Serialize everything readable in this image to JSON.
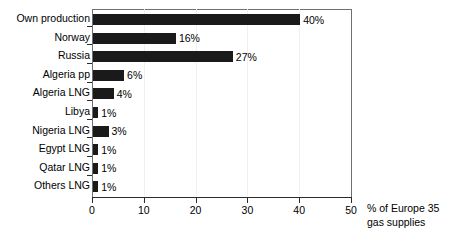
{
  "chart_data": {
    "type": "bar",
    "orientation": "horizontal",
    "title": "",
    "xlabel": "% of Europe 35 gas supplies",
    "ylabel": "",
    "xlim": [
      0,
      50
    ],
    "xticks": [
      0,
      10,
      20,
      30,
      40,
      50
    ],
    "grid": true,
    "legend": null,
    "categories": [
      "Own production",
      "Norway",
      "Russia",
      "Algeria pp",
      "Algeria LNG",
      "Libya",
      "Nigeria LNG",
      "Egypt LNG",
      "Qatar LNG",
      "Others LNG"
    ],
    "values": [
      40,
      16,
      27,
      6,
      4,
      1,
      3,
      1,
      1,
      1
    ],
    "data_labels": [
      "40%",
      "16%",
      "27%",
      "6%",
      "4%",
      "1%",
      "3%",
      "1%",
      "1%",
      "1%"
    ],
    "bar_color": "#1a1a1a"
  },
  "axis_title": {
    "line1": "% of Europe 35",
    "line2": "gas supplies"
  },
  "xtick_labels": [
    "0",
    "10",
    "20",
    "30",
    "40",
    "50"
  ]
}
